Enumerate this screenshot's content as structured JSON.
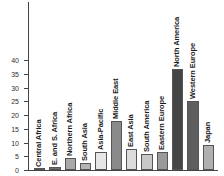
{
  "chart_data": {
    "type": "bar",
    "title": "",
    "subtitle": "",
    "xlabel": "",
    "ylabel": "",
    "ylim": [
      0,
      40
    ],
    "yticks": [
      0,
      5,
      10,
      15,
      20,
      25,
      30,
      35,
      40
    ],
    "ytick_labels": [
      "0",
      "5",
      "10",
      "15",
      "20",
      "25",
      "30",
      "35",
      "40"
    ],
    "grid": false,
    "legend": "none",
    "categories": [
      "Central Africa",
      "E. and S. Africa",
      "Northern Africa",
      "South Asia",
      "Asia-Pacific",
      "Middle East",
      "East Asia",
      "South America",
      "Eastern Europe",
      "North America",
      "Western Europe",
      "Japan"
    ],
    "values": [
      0.4,
      1.2,
      4.2,
      2.7,
      6.7,
      18.0,
      7.8,
      6.0,
      6.6,
      36.8,
      25.0,
      9.2
    ],
    "bar_colors": [
      "#8c8c8c",
      "#6e6e6e",
      "#a8a8a8",
      "#b4b4b4",
      "#e6e6e6",
      "#8a8a8a",
      "#dcdcdc",
      "#c8c8c8",
      "#9a9a9a",
      "#454545",
      "#5e5e5e",
      "#b0b0b0"
    ],
    "axis_color": "#444444"
  }
}
